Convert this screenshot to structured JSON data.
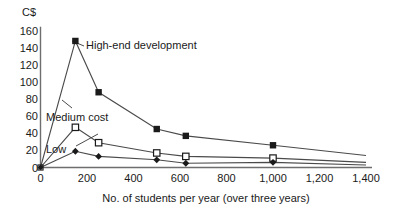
{
  "chart_data": {
    "type": "line",
    "title": "",
    "xlabel": "No. of students per year (over three years)",
    "ylabel": "C$",
    "xlim": [
      0,
      1400
    ],
    "ylim": [
      0,
      160
    ],
    "grid": false,
    "legend_position": "inline-annotations",
    "xticks": [
      "0",
      "200",
      "400",
      "600",
      "800",
      "1,000",
      "1,200",
      "1,400"
    ],
    "xtick_values": [
      0,
      200,
      400,
      600,
      800,
      1000,
      1200,
      1400
    ],
    "yticks": [
      "160",
      "140",
      "120",
      "100",
      "80",
      "60",
      "40",
      "20",
      "0"
    ],
    "ytick_values": [
      160,
      140,
      120,
      100,
      80,
      60,
      40,
      20,
      0
    ],
    "series": [
      {
        "name": "High-end development",
        "marker": "filled-square",
        "x": [
          0,
          150,
          250,
          500,
          625,
          1000,
          1400
        ],
        "values": [
          0,
          148,
          88,
          45,
          37,
          26,
          14
        ]
      },
      {
        "name": "Medium cost",
        "marker": "open-square",
        "x": [
          0,
          150,
          250,
          500,
          625,
          1000,
          1400
        ],
        "values": [
          0,
          47,
          29,
          17,
          13,
          11,
          6
        ]
      },
      {
        "name": "Low",
        "marker": "filled-diamond",
        "x": [
          0,
          150,
          250,
          500,
          625,
          1000,
          1400
        ],
        "values": [
          0,
          19,
          13,
          9,
          5,
          6,
          3
        ]
      }
    ],
    "annotations": [
      {
        "id": "high-end",
        "text": "High-end development"
      },
      {
        "id": "medium",
        "text": "Medium cost"
      },
      {
        "id": "low",
        "text": "Low"
      }
    ]
  },
  "axes": {
    "y_unit": "C$",
    "x_title": "No. of students per year (over three years)"
  },
  "colors": {
    "axis": "#6e6e6e",
    "line": "#4a4a4a",
    "marker_fill": "#1a1a1a",
    "marker_open": "#ffffff",
    "text": "#1a1a1a",
    "background": "#ffffff"
  }
}
